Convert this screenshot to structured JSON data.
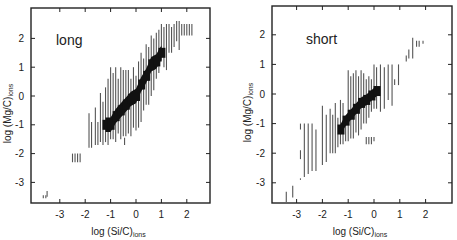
{
  "figure": {
    "panels_count": 2
  },
  "chart_data": [
    {
      "type": "scatter",
      "subtype": "vertical-range-bars",
      "title": "long",
      "panel_label": "long",
      "xlabel": "log (Si/C)ions",
      "xlabel_main": "log (Si/C)",
      "xlabel_sub": "ions",
      "ylabel": "log (Mg/C)ions",
      "ylabel_main": "log (Mg/C)",
      "ylabel_sub": "ions",
      "xlim": [
        -4.1,
        2.9
      ],
      "ylim": [
        -3.7,
        3.0
      ],
      "xticks": [
        -3,
        -2,
        -1,
        0,
        1,
        2
      ],
      "yticks": [
        -3,
        -2,
        -1,
        0,
        1,
        2
      ],
      "grid": false,
      "legend": null,
      "frame_px": {
        "left": 31,
        "top": 8,
        "right": 210,
        "bottom": 203
      },
      "axis_px": {
        "x0": 136,
        "x_per_unit": 25.4,
        "y0": 96,
        "y_per_unit": 28.8
      },
      "light_bars": [
        {
          "x": -3.5,
          "ymin": -3.5,
          "ymax": -3.3
        },
        {
          "x": -3.65,
          "ymin": -3.55,
          "ymax": -3.45
        },
        {
          "x": -3.55,
          "ymin": -3.55,
          "ymax": -3.45
        },
        {
          "x": -2.5,
          "ymin": -2.3,
          "ymax": -2.0
        },
        {
          "x": -2.4,
          "ymin": -2.3,
          "ymax": -2.0
        },
        {
          "x": -2.3,
          "ymin": -2.3,
          "ymax": -2.0
        },
        {
          "x": -2.2,
          "ymin": -2.3,
          "ymax": -2.0
        },
        {
          "x": -1.85,
          "ymin": -1.8,
          "ymax": -0.6
        },
        {
          "x": -1.75,
          "ymin": -1.8,
          "ymax": -0.9
        },
        {
          "x": -1.6,
          "ymin": -1.7,
          "ymax": -0.4
        },
        {
          "x": -1.5,
          "ymin": -1.7,
          "ymax": -0.9
        },
        {
          "x": -1.4,
          "ymin": -1.6,
          "ymax": 0.1
        },
        {
          "x": -1.3,
          "ymin": -1.7,
          "ymax": -0.2
        },
        {
          "x": -1.2,
          "ymin": -1.6,
          "ymax": 0.3
        },
        {
          "x": -1.1,
          "ymin": -1.7,
          "ymax": 0.6
        },
        {
          "x": -1.0,
          "ymin": -1.5,
          "ymax": 1.0
        },
        {
          "x": -0.9,
          "ymin": -1.5,
          "ymax": 0.8
        },
        {
          "x": -0.8,
          "ymin": -1.6,
          "ymax": 1.0
        },
        {
          "x": -0.7,
          "ymin": -1.3,
          "ymax": 0.6
        },
        {
          "x": -0.6,
          "ymin": -1.5,
          "ymax": 1.0
        },
        {
          "x": -0.5,
          "ymin": -1.4,
          "ymax": 0.9
        },
        {
          "x": -0.4,
          "ymin": -1.4,
          "ymax": 0.9
        },
        {
          "x": -0.3,
          "ymin": -1.3,
          "ymax": 0.9
        },
        {
          "x": -0.2,
          "ymin": -1.4,
          "ymax": 0.6
        },
        {
          "x": -0.1,
          "ymin": -1.1,
          "ymax": 1.0
        },
        {
          "x": 0.0,
          "ymin": -1.2,
          "ymax": 0.7
        },
        {
          "x": 0.1,
          "ymin": -1.1,
          "ymax": 1.2
        },
        {
          "x": 0.2,
          "ymin": -0.9,
          "ymax": 1.5
        },
        {
          "x": 0.3,
          "ymin": -0.5,
          "ymax": 1.3
        },
        {
          "x": 0.4,
          "ymin": -0.3,
          "ymax": 1.8
        },
        {
          "x": 0.5,
          "ymin": -0.3,
          "ymax": 1.7
        },
        {
          "x": 0.6,
          "ymin": 0.0,
          "ymax": 2.1
        },
        {
          "x": 0.7,
          "ymin": 0.2,
          "ymax": 2.0
        },
        {
          "x": 0.8,
          "ymin": 0.6,
          "ymax": 2.2
        },
        {
          "x": 0.9,
          "ymin": 0.8,
          "ymax": 2.3
        },
        {
          "x": 1.0,
          "ymin": 1.2,
          "ymax": 2.5
        },
        {
          "x": 1.1,
          "ymin": 1.0,
          "ymax": 2.4
        },
        {
          "x": 1.2,
          "ymin": 0.9,
          "ymax": 2.5
        },
        {
          "x": 1.3,
          "ymin": 1.5,
          "ymax": 2.5
        },
        {
          "x": 1.4,
          "ymin": 1.5,
          "ymax": 2.4
        },
        {
          "x": 1.5,
          "ymin": 1.7,
          "ymax": 2.5
        },
        {
          "x": 1.6,
          "ymin": 1.9,
          "ymax": 2.6
        },
        {
          "x": 1.7,
          "ymin": 1.6,
          "ymax": 2.6
        },
        {
          "x": 1.8,
          "ymin": 2.1,
          "ymax": 2.5
        },
        {
          "x": 1.9,
          "ymin": 2.1,
          "ymax": 2.5
        },
        {
          "x": 2.0,
          "ymin": 2.1,
          "ymax": 2.5
        },
        {
          "x": 2.1,
          "ymin": 2.1,
          "ymax": 2.5
        },
        {
          "x": 2.2,
          "ymin": 2.1,
          "ymax": 2.5
        },
        {
          "x": -0.45,
          "ymin": -1.7,
          "ymax": -1.45
        }
      ],
      "dense_band": [
        [
          -1.2,
          -1.0
        ],
        [
          -1.0,
          -1.0
        ],
        [
          -0.8,
          -0.7
        ],
        [
          -0.6,
          -0.5
        ],
        [
          -0.4,
          -0.3
        ],
        [
          -0.2,
          -0.1
        ],
        [
          0.0,
          0.0
        ],
        [
          0.2,
          0.4
        ],
        [
          0.4,
          0.7
        ],
        [
          0.6,
          1.1
        ],
        [
          0.8,
          1.2
        ],
        [
          1.0,
          1.5
        ]
      ],
      "dense_halfwidth": 0.25
    },
    {
      "type": "scatter",
      "subtype": "vertical-range-bars",
      "title": "short",
      "panel_label": "short",
      "xlabel": "log (Si/C)ions",
      "xlabel_main": "log (Si/C)",
      "xlabel_sub": "ions",
      "ylabel": "log (Mg/C)ions",
      "ylabel_main": "log (Mg/C)",
      "ylabel_sub": "ions",
      "xlim": [
        -4.0,
        3.0
      ],
      "ylim": [
        -3.7,
        3.0
      ],
      "xticks": [
        -3,
        -2,
        -1,
        0,
        1,
        2
      ],
      "yticks": [
        -3,
        -2,
        -1,
        0,
        1,
        2
      ],
      "grid": false,
      "legend": null,
      "frame_px": {
        "left": 36,
        "top": 6,
        "right": 216,
        "bottom": 203
      },
      "axis_px": {
        "x0": 138,
        "x_per_unit": 25.8,
        "y0": 94,
        "y_per_unit": 29.6
      },
      "light_bars": [
        {
          "x": -3.4,
          "ymin": -3.65,
          "ymax": -3.3
        },
        {
          "x": -3.15,
          "ymin": -3.5,
          "ymax": -3.1
        },
        {
          "x": -2.85,
          "ymin": -2.9,
          "ymax": -2.85
        },
        {
          "x": -2.85,
          "ymin": -2.2,
          "ymax": -1.9
        },
        {
          "x": -2.85,
          "ymin": -1.2,
          "ymax": -1.0
        },
        {
          "x": -2.7,
          "ymin": -2.8,
          "ymax": -1.0
        },
        {
          "x": -2.55,
          "ymin": -2.7,
          "ymax": -1.0
        },
        {
          "x": -2.4,
          "ymin": -2.6,
          "ymax": -1.0
        },
        {
          "x": -2.25,
          "ymin": -2.6,
          "ymax": -1.2
        },
        {
          "x": -2.0,
          "ymin": -2.4,
          "ymax": -0.4
        },
        {
          "x": -1.85,
          "ymin": -2.3,
          "ymax": -0.7
        },
        {
          "x": -1.7,
          "ymin": -2.0,
          "ymax": -0.5
        },
        {
          "x": -1.6,
          "ymin": -2.0,
          "ymax": -0.7
        },
        {
          "x": -1.5,
          "ymin": -2.0,
          "ymax": -0.3
        },
        {
          "x": -1.4,
          "ymin": -1.8,
          "ymax": -0.8
        },
        {
          "x": -1.3,
          "ymin": -1.7,
          "ymax": -0.2
        },
        {
          "x": -1.2,
          "ymin": -1.7,
          "ymax": -0.3
        },
        {
          "x": -1.1,
          "ymin": -1.6,
          "ymax": -0.8
        },
        {
          "x": -1.0,
          "ymin": -1.6,
          "ymax": 0.8
        },
        {
          "x": -0.9,
          "ymin": -1.5,
          "ymax": 0.6
        },
        {
          "x": -0.8,
          "ymin": -1.5,
          "ymax": 0.7
        },
        {
          "x": -0.7,
          "ymin": -1.3,
          "ymax": 0.8
        },
        {
          "x": -0.6,
          "ymin": -1.4,
          "ymax": 0.6
        },
        {
          "x": -0.5,
          "ymin": -1.2,
          "ymax": 0.8
        },
        {
          "x": -0.4,
          "ymin": -1.0,
          "ymax": 0.7
        },
        {
          "x": -0.3,
          "ymin": -1.0,
          "ymax": 0.5
        },
        {
          "x": -0.2,
          "ymin": -0.8,
          "ymax": 0.6
        },
        {
          "x": -0.1,
          "ymin": -0.6,
          "ymax": 0.5
        },
        {
          "x": 0.0,
          "ymin": -0.5,
          "ymax": 1.0
        },
        {
          "x": 0.1,
          "ymin": -0.5,
          "ymax": 0.9
        },
        {
          "x": 0.25,
          "ymin": -0.6,
          "ymax": 1.0
        },
        {
          "x": 0.4,
          "ymin": -0.5,
          "ymax": 0.9
        },
        {
          "x": 0.55,
          "ymin": -0.2,
          "ymax": 1.0
        },
        {
          "x": 0.7,
          "ymin": -0.4,
          "ymax": 1.0
        },
        {
          "x": 0.8,
          "ymin": 0.3,
          "ymax": 0.5
        },
        {
          "x": 0.95,
          "ymin": 0.3,
          "ymax": 1.0
        },
        {
          "x": 1.25,
          "ymin": 1.1,
          "ymax": 1.3
        },
        {
          "x": 1.35,
          "ymin": 1.2,
          "ymax": 1.5
        },
        {
          "x": 1.5,
          "ymin": 1.2,
          "ymax": 1.9
        },
        {
          "x": 1.65,
          "ymin": 1.6,
          "ymax": 1.8
        },
        {
          "x": 1.75,
          "ymin": 1.6,
          "ymax": 1.8
        },
        {
          "x": 1.9,
          "ymin": 1.7,
          "ymax": 1.8
        },
        {
          "x": -0.3,
          "ymin": -1.7,
          "ymax": -1.45
        },
        {
          "x": -0.2,
          "ymin": -1.7,
          "ymax": -1.45
        },
        {
          "x": -0.1,
          "ymin": -1.7,
          "ymax": -1.45
        },
        {
          "x": 0.0,
          "ymin": -1.6,
          "ymax": -1.45
        }
      ],
      "dense_band": [
        [
          -1.3,
          -1.2
        ],
        [
          -1.1,
          -0.9
        ],
        [
          -0.9,
          -0.7
        ],
        [
          -0.7,
          -0.5
        ],
        [
          -0.5,
          -0.3
        ],
        [
          -0.3,
          -0.2
        ],
        [
          -0.1,
          -0.05
        ],
        [
          0.1,
          0.1
        ]
      ],
      "dense_halfwidth": 0.18
    }
  ]
}
